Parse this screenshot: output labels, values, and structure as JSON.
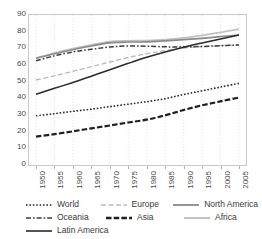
{
  "chart_data": {
    "type": "line",
    "title": "",
    "xlabel": "",
    "ylabel": "",
    "xlim": [
      1950,
      2005
    ],
    "ylim": [
      0,
      90
    ],
    "grid": "vertical-dotted",
    "legend_position": "bottom",
    "x": [
      1950,
      1955,
      1960,
      1965,
      1970,
      1975,
      1980,
      1985,
      1990,
      1995,
      2000,
      2005
    ],
    "categories": [
      "1950",
      "1955",
      "1960",
      "1965",
      "1970",
      "1975",
      "1980",
      "1985",
      "1990",
      "1995",
      "2000",
      "2005"
    ],
    "yticks": [
      0,
      10,
      20,
      30,
      40,
      50,
      60,
      70,
      80,
      90
    ],
    "series": [
      {
        "name": "World",
        "style": "dotted",
        "color": "#2a2a2a",
        "values": [
          29.5,
          30.8,
          32.2,
          33.5,
          35.0,
          36.5,
          38.0,
          39.8,
          42.3,
          44.5,
          46.8,
          49.0
        ]
      },
      {
        "name": "Oceania",
        "style": "dash-dot",
        "color": "#3c3c3c",
        "values": [
          62.5,
          65.5,
          67.8,
          69.4,
          70.8,
          71.4,
          71.3,
          70.9,
          70.9,
          71.1,
          71.6,
          72.0
        ]
      },
      {
        "name": "Latin America",
        "style": "solid",
        "color": "#2a2a2a",
        "values": [
          42.5,
          46.0,
          49.5,
          53.2,
          57.2,
          61.0,
          64.6,
          67.8,
          70.7,
          73.2,
          75.6,
          78.0
        ]
      },
      {
        "name": "Europe",
        "style": "dashed-light",
        "color": "#b9b9b9",
        "values": [
          51.0,
          53.5,
          56.2,
          59.0,
          61.8,
          64.5,
          66.8,
          68.6,
          70.2,
          71.0,
          71.6,
          72.0
        ]
      },
      {
        "name": "Asia",
        "style": "dashed-heavy",
        "color": "#1f1f1f",
        "values": [
          17.0,
          18.5,
          20.2,
          22.0,
          23.7,
          25.5,
          27.2,
          29.8,
          33.0,
          35.8,
          38.2,
          40.5
        ]
      },
      {
        "name": "North America",
        "style": "solid-gray",
        "color": "#8a8a8a",
        "values": [
          64.0,
          66.8,
          69.2,
          71.4,
          73.3,
          73.8,
          73.9,
          74.5,
          75.2,
          76.0,
          77.0,
          78.0
        ]
      },
      {
        "name": "Africa",
        "style": "solid-light",
        "color": "#c2c2c2",
        "values": [
          64.2,
          67.2,
          69.8,
          72.0,
          74.0,
          74.5,
          74.6,
          75.2,
          76.3,
          77.8,
          79.6,
          81.5
        ]
      }
    ]
  },
  "legend": {
    "rows": [
      [
        {
          "label": "World",
          "swatch": "dotted-swatch"
        },
        {
          "label": "Europe",
          "swatch": "dashed-light-swatch"
        },
        {
          "label": "North America",
          "swatch": "solid-gray-swatch"
        }
      ],
      [
        {
          "label": "Oceania",
          "swatch": "dash-dot-swatch"
        },
        {
          "label": "Asia",
          "swatch": "dashed-heavy-swatch"
        },
        {
          "label": "Africa",
          "swatch": "solid-light-swatch"
        }
      ],
      [
        {
          "label": "Latin America",
          "swatch": "solid-swatch"
        }
      ]
    ]
  }
}
